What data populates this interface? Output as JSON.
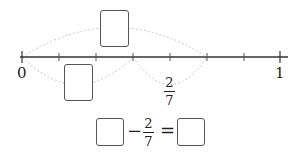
{
  "number_line": {
    "start_label": "0",
    "end_label": "1",
    "divisions": 7,
    "jump_label": {
      "numerator": "2",
      "denominator": "7"
    },
    "blank_above": "",
    "blank_below": ""
  },
  "equation": {
    "left_blank": "",
    "operator_minus": "−",
    "fraction": {
      "numerator": "2",
      "denominator": "7"
    },
    "operator_equals": "=",
    "right_blank": ""
  },
  "colors": {
    "line": "#333333",
    "arc": "#c8c8c8",
    "box_border": "#555555"
  }
}
